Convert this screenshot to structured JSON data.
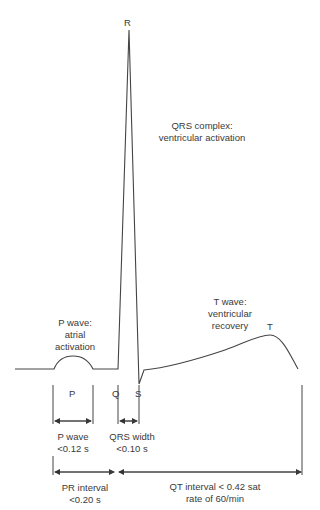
{
  "diagram": {
    "wave_labels": {
      "R": "R",
      "P": "P",
      "Q": "Q",
      "S": "S",
      "T": "T"
    },
    "annotations": {
      "qrs_complex": [
        "QRS complex:",
        "ventricular activation"
      ],
      "p_wave": [
        "P wave:",
        "atrial",
        "activation"
      ],
      "t_wave": [
        "T wave:",
        "ventricular",
        "recovery"
      ]
    },
    "intervals": {
      "p_wave": [
        "P wave",
        "<0.12 s"
      ],
      "qrs_width": [
        "QRS width",
        "<0.10 s"
      ],
      "pr_interval": [
        "PR interval",
        "<0.20 s"
      ],
      "qt_interval": [
        "QT interval < 0.42 sat",
        "rate of 60/min"
      ]
    },
    "colors": {
      "line": "#444444",
      "text": "#3a3a3a",
      "background": "#ffffff"
    }
  }
}
